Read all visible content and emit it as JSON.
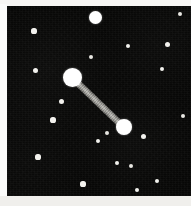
{
  "figure": {
    "kind": "astronomical-image",
    "width": 191,
    "height": 206,
    "alt": "Dark star field with a bright double star joined by a light bar"
  },
  "colors": {
    "sky": "#070706",
    "border": "#f4f3f0",
    "star_bright": "#ffffff",
    "star_faint": "#e8e7e2",
    "bar_light": "#b9b8b2",
    "bar_dark": "#5c5b57"
  },
  "sky_field": {
    "x": 7,
    "y": 6,
    "width": 184,
    "height": 190
  },
  "pair_bar": {
    "label": "separation-bar",
    "x1": 72,
    "y1": 77,
    "x2": 124,
    "y2": 127,
    "thickness": 7
  },
  "stars": [
    {
      "name": "primary-component",
      "x": 72,
      "y": 77,
      "r": 9.5,
      "cls": "bright"
    },
    {
      "name": "secondary-component",
      "x": 124,
      "y": 127,
      "r": 8.0,
      "cls": "bright"
    },
    {
      "name": "field-star-top",
      "x": 95,
      "y": 17,
      "r": 6.5,
      "cls": "bright"
    },
    {
      "name": "field-star-01",
      "x": 34,
      "y": 31,
      "r": 2.6,
      "cls": "mid"
    },
    {
      "name": "field-star-02",
      "x": 180,
      "y": 14,
      "r": 2.2,
      "cls": "faint"
    },
    {
      "name": "field-star-03",
      "x": 128,
      "y": 46,
      "r": 2.4,
      "cls": "mid"
    },
    {
      "name": "field-star-04",
      "x": 167,
      "y": 44,
      "r": 2.5,
      "cls": "mid"
    },
    {
      "name": "field-star-05",
      "x": 91,
      "y": 57,
      "r": 2.2,
      "cls": "faint"
    },
    {
      "name": "field-star-06",
      "x": 35,
      "y": 70,
      "r": 2.5,
      "cls": "mid"
    },
    {
      "name": "field-star-07",
      "x": 162,
      "y": 69,
      "r": 2.4,
      "cls": "mid"
    },
    {
      "name": "field-star-08",
      "x": 61,
      "y": 101,
      "r": 2.5,
      "cls": "mid"
    },
    {
      "name": "field-star-09",
      "x": 183,
      "y": 116,
      "r": 2.3,
      "cls": "faint"
    },
    {
      "name": "field-star-10",
      "x": 53,
      "y": 120,
      "r": 2.6,
      "cls": "mid"
    },
    {
      "name": "field-star-11",
      "x": 107,
      "y": 133,
      "r": 2.3,
      "cls": "faint"
    },
    {
      "name": "field-star-12",
      "x": 143,
      "y": 136,
      "r": 2.5,
      "cls": "mid"
    },
    {
      "name": "field-star-13",
      "x": 98,
      "y": 141,
      "r": 2.4,
      "cls": "mid"
    },
    {
      "name": "field-star-14",
      "x": 38,
      "y": 157,
      "r": 2.6,
      "cls": "mid"
    },
    {
      "name": "field-star-15",
      "x": 117,
      "y": 163,
      "r": 2.4,
      "cls": "mid"
    },
    {
      "name": "field-star-16",
      "x": 131,
      "y": 166,
      "r": 2.2,
      "cls": "faint"
    },
    {
      "name": "field-star-17",
      "x": 83,
      "y": 184,
      "r": 2.6,
      "cls": "mid"
    },
    {
      "name": "field-star-18",
      "x": 137,
      "y": 190,
      "r": 2.4,
      "cls": "mid"
    },
    {
      "name": "field-star-19",
      "x": 157,
      "y": 181,
      "r": 2.4,
      "cls": "mid"
    }
  ]
}
